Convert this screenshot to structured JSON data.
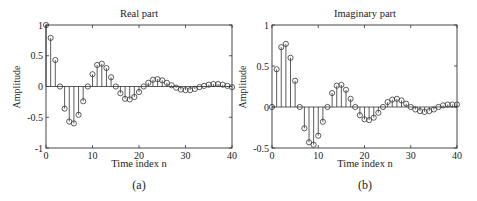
{
  "chart_data": [
    {
      "type": "stem",
      "title": "Real part",
      "xlabel": "Time index n",
      "ylabel": "Amplitude",
      "caption": "(a)",
      "xlim": [
        0,
        40
      ],
      "ylim": [
        -1,
        1
      ],
      "xticks": [
        0,
        10,
        20,
        30,
        40
      ],
      "yticks": [
        -1,
        -0.5,
        0,
        0.5,
        1
      ],
      "ytick_labels": [
        "-1",
        "-0.5",
        "0",
        "0.5",
        "1"
      ],
      "x": [
        0,
        1,
        2,
        3,
        4,
        5,
        6,
        7,
        8,
        9,
        10,
        11,
        12,
        13,
        14,
        15,
        16,
        17,
        18,
        19,
        20,
        21,
        22,
        23,
        24,
        25,
        26,
        27,
        28,
        29,
        30,
        31,
        32,
        33,
        34,
        35,
        36,
        37,
        38,
        39,
        40
      ],
      "values": [
        1.0,
        0.79,
        0.43,
        0.0,
        -0.36,
        -0.57,
        -0.6,
        -0.46,
        -0.24,
        0.0,
        0.2,
        0.35,
        0.37,
        0.3,
        0.15,
        0.0,
        -0.11,
        -0.2,
        -0.21,
        -0.17,
        -0.09,
        0.0,
        0.06,
        0.11,
        0.12,
        0.1,
        0.06,
        0.02,
        -0.02,
        -0.05,
        -0.06,
        -0.06,
        -0.04,
        -0.01,
        0.01,
        0.03,
        0.04,
        0.04,
        0.03,
        0.01,
        -0.01
      ]
    },
    {
      "type": "stem",
      "title": "Imaginary part",
      "xlabel": "Time index n",
      "ylabel": "Amplitude",
      "caption": "(b)",
      "xlim": [
        0,
        40
      ],
      "ylim": [
        -0.5,
        1
      ],
      "xticks": [
        0,
        10,
        20,
        30,
        40
      ],
      "yticks": [
        -0.5,
        0,
        0.5,
        1
      ],
      "ytick_labels": [
        "-0.5",
        "0",
        "0.5",
        "1"
      ],
      "x": [
        0,
        1,
        2,
        3,
        4,
        5,
        6,
        7,
        8,
        9,
        10,
        11,
        12,
        13,
        14,
        15,
        16,
        17,
        18,
        19,
        20,
        21,
        22,
        23,
        24,
        25,
        26,
        27,
        28,
        29,
        30,
        31,
        32,
        33,
        34,
        35,
        36,
        37,
        38,
        39,
        40
      ],
      "values": [
        0.0,
        0.46,
        0.73,
        0.77,
        0.6,
        0.32,
        0.0,
        -0.26,
        -0.43,
        -0.46,
        -0.35,
        -0.18,
        0.0,
        0.17,
        0.26,
        0.27,
        0.21,
        0.1,
        0.0,
        -0.1,
        -0.15,
        -0.16,
        -0.13,
        -0.07,
        0.0,
        0.06,
        0.09,
        0.1,
        0.08,
        0.04,
        0.0,
        -0.03,
        -0.05,
        -0.06,
        -0.05,
        -0.03,
        0.0,
        0.02,
        0.03,
        0.03,
        0.03
      ]
    }
  ],
  "panels": [
    {
      "box": {
        "x0": 46,
        "x1": 232,
        "y0": 25,
        "y1": 148
      }
    },
    {
      "box": {
        "x0": 272,
        "x1": 457,
        "y0": 25,
        "y1": 148
      }
    }
  ]
}
